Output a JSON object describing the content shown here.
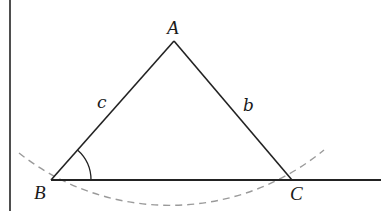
{
  "diagram": {
    "type": "geometry-triangle",
    "vertices": {
      "A": {
        "label": "A",
        "x": 174,
        "y": 41
      },
      "B": {
        "label": "B",
        "x": 51,
        "y": 180
      },
      "C": {
        "label": "C",
        "x": 292,
        "y": 180
      }
    },
    "sides": {
      "c": {
        "label": "c",
        "from": "B",
        "to": "A"
      },
      "b": {
        "label": "b",
        "from": "A",
        "to": "C"
      },
      "a": {
        "label": "",
        "from": "B",
        "to": "C"
      }
    },
    "angle_marker": {
      "vertex": "B",
      "radius": 40
    },
    "baseline_extension": {
      "from_x": 51,
      "to_x": 381,
      "y": 180
    },
    "vertical_line": {
      "x": 10,
      "y1": 0,
      "y2": 211
    },
    "dashed_arc": {
      "center_x": 171.5,
      "center_y": -31,
      "radius": 243,
      "style": "dashed"
    },
    "colors": {
      "stroke": "#222222",
      "dashed": "#999999",
      "background": "#ffffff"
    }
  }
}
